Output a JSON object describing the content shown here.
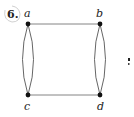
{
  "problem": {
    "number": "6.",
    "partial_glyph": "·"
  },
  "graph": {
    "vertices": [
      {
        "id": "a",
        "label": "a"
      },
      {
        "id": "b",
        "label": "b"
      },
      {
        "id": "c",
        "label": "c"
      },
      {
        "id": "d",
        "label": "d"
      }
    ],
    "edges": [
      {
        "from": "a",
        "to": "b",
        "count": 1
      },
      {
        "from": "c",
        "to": "d",
        "count": 1
      },
      {
        "from": "a",
        "to": "c",
        "count": 2
      },
      {
        "from": "b",
        "to": "d",
        "count": 2
      }
    ],
    "colors": {
      "edge": "#555555",
      "vertex": "#111111"
    }
  }
}
